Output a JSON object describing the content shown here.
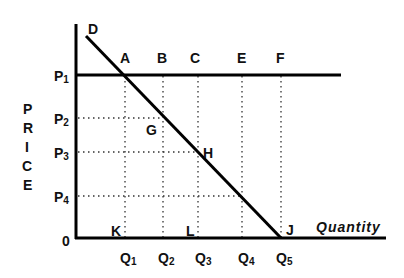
{
  "diagram": {
    "type": "demand-curve-price-quantity",
    "y_axis_title_letters": [
      "P",
      "R",
      "I",
      "C",
      "E"
    ],
    "x_axis_title": "Quantity",
    "origin_label": "0",
    "curve_label": "D",
    "price_levels": [
      {
        "main": "P",
        "sub": "1"
      },
      {
        "main": "P",
        "sub": "2"
      },
      {
        "main": "P",
        "sub": "3"
      },
      {
        "main": "P",
        "sub": "4"
      }
    ],
    "quantity_levels": [
      {
        "main": "Q",
        "sub": "1"
      },
      {
        "main": "Q",
        "sub": "2"
      },
      {
        "main": "Q",
        "sub": "3"
      },
      {
        "main": "Q",
        "sub": "4"
      },
      {
        "main": "Q",
        "sub": "5"
      }
    ],
    "points_on_p1_line": [
      "A",
      "B",
      "C",
      "E",
      "F"
    ],
    "point_g": "G",
    "point_h": "H",
    "point_j": "J",
    "point_k": "K",
    "point_l": "L"
  }
}
